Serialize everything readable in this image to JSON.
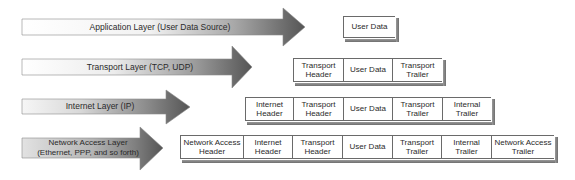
{
  "diagram": {
    "colors": {
      "arrow_light": "#ffffff",
      "arrow_dark": "#555555",
      "box_border": "#6a6a6a",
      "box_shadow": "#8a8a8a",
      "text": "#2a2a2a"
    },
    "layers": [
      {
        "label": "Application Layer (User Data Source)",
        "label_line2": "",
        "segments": [
          "User Data"
        ]
      },
      {
        "label": "Transport Layer (TCP, UDP)",
        "label_line2": "",
        "segments": [
          "Transport Header",
          "User Data",
          "Transport Trailer"
        ]
      },
      {
        "label": "Internet Layer (IP)",
        "label_line2": "",
        "segments": [
          "Internet Header",
          "Transport Header",
          "User Data",
          "Transport Trailer",
          "Internal Trailer"
        ]
      },
      {
        "label": "Network Access Layer",
        "label_line2": "(Ethernet, PPP, and so forth)",
        "segments": [
          "Network Access Header",
          "Internet Header",
          "Transport Header",
          "User Data",
          "Transport Trailer",
          "Internal Trailer",
          "Network Access Trailer"
        ]
      }
    ],
    "cells": {
      "r1": [
        {
          "l1": "User Data",
          "l2": ""
        }
      ],
      "r2": [
        {
          "l1": "Transport",
          "l2": "Header"
        },
        {
          "l1": "User Data",
          "l2": ""
        },
        {
          "l1": "Transport",
          "l2": "Trailer"
        }
      ],
      "r3": [
        {
          "l1": "Internet",
          "l2": "Header"
        },
        {
          "l1": "Transport",
          "l2": "Header"
        },
        {
          "l1": "User Data",
          "l2": ""
        },
        {
          "l1": "Transport",
          "l2": "Trailer"
        },
        {
          "l1": "Internal",
          "l2": "Trailer"
        }
      ],
      "r4": [
        {
          "l1": "Network Access",
          "l2": "Header"
        },
        {
          "l1": "Internet",
          "l2": "Header"
        },
        {
          "l1": "Transport",
          "l2": "Header"
        },
        {
          "l1": "User Data",
          "l2": ""
        },
        {
          "l1": "Transport",
          "l2": "Trailer"
        },
        {
          "l1": "Internal",
          "l2": "Trailer"
        },
        {
          "l1": "Network Access",
          "l2": "Trailer"
        }
      ]
    }
  }
}
